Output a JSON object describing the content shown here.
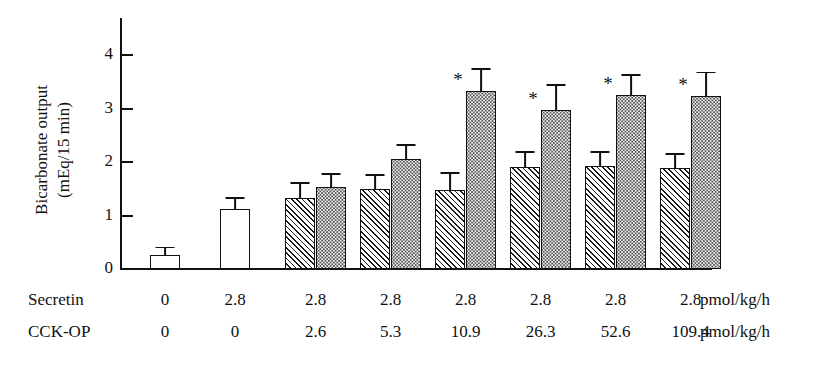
{
  "chart_data": {
    "type": "bar",
    "title": "",
    "xlabel": "",
    "ylabel": "Bicarbonate output (mEq/15 min)",
    "ylabel_line1": "Bicarbonate output",
    "ylabel_line2": "(mEq/15 min)",
    "ylim": [
      0,
      4.4
    ],
    "yticks": [
      0,
      1,
      2,
      3,
      4
    ],
    "ytick_labels": [
      "0",
      "1",
      "2",
      "3",
      "4"
    ],
    "grid": false,
    "legend": "none",
    "series": [
      {
        "name": "before",
        "pattern": "hatch",
        "values": [
          null,
          null,
          1.32,
          1.5,
          1.48,
          1.9,
          1.93,
          1.88
        ],
        "errors": [
          null,
          null,
          0.3,
          0.27,
          0.33,
          0.3,
          0.27,
          0.28
        ],
        "significant": [
          false,
          false,
          false,
          false,
          false,
          false,
          false,
          false
        ]
      },
      {
        "name": "after",
        "pattern": "dots",
        "values": [
          null,
          null,
          1.53,
          2.06,
          3.33,
          2.98,
          3.25,
          3.24
        ],
        "errors": [
          null,
          null,
          0.26,
          0.28,
          0.42,
          0.48,
          0.4,
          0.45
        ],
        "significant": [
          false,
          false,
          false,
          false,
          true,
          true,
          true,
          true
        ]
      },
      {
        "name": "control",
        "pattern": "open",
        "values": [
          0.27,
          1.13,
          null,
          null,
          null,
          null,
          null,
          null
        ],
        "errors": [
          0.15,
          0.22,
          null,
          null,
          null,
          null,
          null,
          null
        ],
        "significant": [
          false,
          false,
          false,
          false,
          false,
          false,
          false,
          false
        ]
      }
    ],
    "conditions": {
      "rows": [
        {
          "label": "Secretin",
          "values": [
            "0",
            "2.8",
            "2.8",
            "2.8",
            "2.8",
            "2.8",
            "2.8",
            "2.8"
          ],
          "unit": "pmol/kg/h"
        },
        {
          "label": "CCK-OP",
          "values": [
            "0",
            "0",
            "2.6",
            "5.3",
            "10.9",
            "26.3",
            "52.6",
            "109.4"
          ],
          "unit": "pmol/kg/h"
        }
      ]
    },
    "annotations": {
      "asterisk": "*",
      "asterisk_meaning": "significant"
    }
  },
  "colors": {
    "ink": "#111111",
    "background": "#ffffff",
    "dot_fill": "#f0f0f0"
  }
}
